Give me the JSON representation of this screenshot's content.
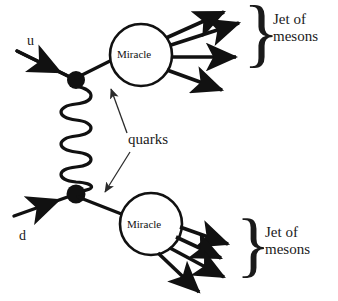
{
  "diagram": {
    "type": "feynman-diagram",
    "colors": {
      "ink": "#111111",
      "background": "#ffffff",
      "thin_pointer": "#2b2b2b"
    },
    "incoming_particles": [
      {
        "id": "u",
        "label": "u",
        "description": "incoming up quark, upper left"
      },
      {
        "id": "d",
        "label": "d",
        "description": "incoming down quark, lower left"
      }
    ],
    "vertices": [
      {
        "id": "top-vertex",
        "x": 76,
        "y": 80
      },
      {
        "id": "bottom-vertex",
        "x": 76,
        "y": 194
      }
    ],
    "exchange": {
      "id": "gluon",
      "style": "coil",
      "loops": 8,
      "from": "top-vertex",
      "to": "bottom-vertex"
    },
    "blobs": [
      {
        "id": "miracle-top",
        "label": "Miracle",
        "cx": 141,
        "cy": 55,
        "r": 31,
        "outgoing": 4
      },
      {
        "id": "miracle-bottom",
        "label": "Miracle",
        "cx": 151,
        "cy": 224,
        "r": 31,
        "outgoing": 4
      }
    ],
    "annotations": [
      {
        "id": "quarks",
        "label": "quarks",
        "pointers": 2
      }
    ],
    "jets": [
      {
        "id": "jet-top",
        "brace": "}",
        "line1": "Jet of",
        "line2": "mesons"
      },
      {
        "id": "jet-bottom",
        "brace": "}",
        "line1": "Jet of",
        "line2": "mesons"
      }
    ]
  }
}
